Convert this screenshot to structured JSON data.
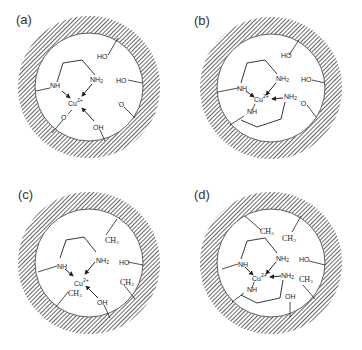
{
  "figure": {
    "panels": [
      {
        "label": "(a)",
        "metal": "Cu",
        "charge": "2+",
        "ligands": [
          "NH",
          "NH2",
          "O-",
          "OH"
        ],
        "surface_groups": [
          "HO",
          "HO",
          "-O"
        ]
      },
      {
        "label": "(b)",
        "metal": "Cu",
        "charge": "2+",
        "ligands": [
          "NH",
          "NH2",
          "NH",
          "NH2"
        ],
        "surface_groups": [
          "HO",
          "HO",
          "-O"
        ]
      },
      {
        "label": "(c)",
        "metal": "Cu",
        "charge": "2+",
        "ligands": [
          "NH",
          "NH2",
          "CH3",
          "OH"
        ],
        "surface_groups": [
          "CH3",
          "HO",
          "CH3"
        ]
      },
      {
        "label": "(d)",
        "metal": "Cu",
        "charge": "2+",
        "ligands": [
          "NH",
          "NH2",
          "NH",
          "NH2"
        ],
        "surface_groups": [
          "CH3",
          "CH3",
          "HO",
          "CH3",
          "OH"
        ]
      }
    ]
  },
  "text": {
    "nh": "NH",
    "nh2_main": "NH",
    "nh2_sub": "2",
    "cu": "Cu",
    "cu_charge": "2+",
    "ho": "HO",
    "oh": "OH",
    "o_minus_pre": "-",
    "o": "O",
    "o_minus_post": "-",
    "ch3_main": "CH",
    "ch3_sub": "3"
  }
}
